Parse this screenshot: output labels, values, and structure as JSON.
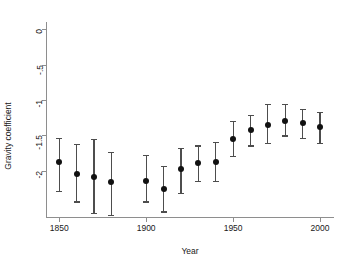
{
  "chart_data": {
    "type": "scatter",
    "title": "",
    "subtitle": "",
    "xlabel": "Year",
    "ylabel": "Gravity coefficient",
    "xlim": [
      1843,
      2008
    ],
    "ylim": [
      -2.65,
      0.1
    ],
    "grid": false,
    "legend": "none",
    "error_bars": "vertical confidence intervals",
    "x_ticks": [
      1850,
      1900,
      1950,
      2000
    ],
    "x_tick_labels": [
      "1850",
      "1900",
      "1950",
      "2000"
    ],
    "y_ticks": [
      0,
      -0.5,
      -1,
      -1.5,
      -2
    ],
    "y_tick_labels": [
      "0",
      "-.5",
      "-1",
      "-1.5",
      "-2"
    ],
    "x": [
      1850,
      1860,
      1870,
      1880,
      1900,
      1910,
      1920,
      1930,
      1940,
      1950,
      1960,
      1970,
      1980,
      1990,
      2000
    ],
    "values": [
      -1.88,
      -2.04,
      -2.09,
      -2.16,
      -2.14,
      -2.26,
      -1.98,
      -1.89,
      -1.87,
      -1.55,
      -1.43,
      -1.35,
      -1.29,
      -1.33,
      -1.38
    ],
    "ci_low": [
      -2.28,
      -2.43,
      -2.59,
      -2.62,
      -2.43,
      -2.57,
      -2.31,
      -2.14,
      -2.14,
      -1.79,
      -1.64,
      -1.61,
      -1.5,
      -1.54,
      -1.6
    ],
    "ci_high": [
      -1.53,
      -1.62,
      -1.55,
      -1.73,
      -1.78,
      -1.93,
      -1.68,
      -1.64,
      -1.59,
      -1.29,
      -1.21,
      -1.06,
      -1.05,
      -1.13,
      -1.17
    ],
    "points": [
      {
        "x": 1850,
        "y": -1.88,
        "lo": -2.28,
        "hi": -1.53
      },
      {
        "x": 1860,
        "y": -2.04,
        "lo": -2.43,
        "hi": -1.62
      },
      {
        "x": 1870,
        "y": -2.09,
        "lo": -2.59,
        "hi": -1.55
      },
      {
        "x": 1880,
        "y": -2.16,
        "lo": -2.62,
        "hi": -1.73
      },
      {
        "x": 1900,
        "y": -2.14,
        "lo": -2.43,
        "hi": -1.78
      },
      {
        "x": 1910,
        "y": -2.26,
        "lo": -2.57,
        "hi": -1.93
      },
      {
        "x": 1920,
        "y": -1.98,
        "lo": -2.31,
        "hi": -1.68
      },
      {
        "x": 1930,
        "y": -1.89,
        "lo": -2.14,
        "hi": -1.64
      },
      {
        "x": 1940,
        "y": -1.87,
        "lo": -2.14,
        "hi": -1.59
      },
      {
        "x": 1950,
        "y": -1.55,
        "lo": -1.79,
        "hi": -1.29
      },
      {
        "x": 1960,
        "y": -1.43,
        "lo": -1.64,
        "hi": -1.21
      },
      {
        "x": 1970,
        "y": -1.35,
        "lo": -1.61,
        "hi": -1.06
      },
      {
        "x": 1980,
        "y": -1.29,
        "lo": -1.5,
        "hi": -1.05
      },
      {
        "x": 1990,
        "y": -1.33,
        "lo": -1.54,
        "hi": -1.13
      },
      {
        "x": 2000,
        "y": -1.38,
        "lo": -1.6,
        "hi": -1.17
      }
    ],
    "colors": {
      "marker": "#111111",
      "whisker": "#4d4d4d",
      "axis": "#8e8e8e",
      "background": "#ffffff",
      "text": "#202020"
    }
  }
}
